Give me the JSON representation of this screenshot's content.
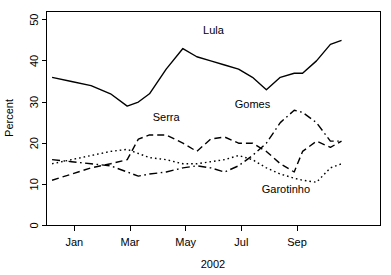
{
  "chart_data": {
    "type": "line",
    "title": "",
    "xlabel": "2002",
    "ylabel": "Percent",
    "xlim": [
      0,
      12
    ],
    "ylim": [
      0,
      52
    ],
    "grid": false,
    "legend": "inline-annotations",
    "x_tick_labels": [
      "Jan",
      "Mar",
      "May",
      "Jul",
      "Sep"
    ],
    "x_tick_values": [
      1,
      3,
      5,
      7,
      9
    ],
    "y_tick_labels": [
      "0",
      "10",
      "20",
      "30",
      "40",
      "50"
    ],
    "y_tick_values": [
      0,
      10,
      20,
      30,
      40,
      50
    ],
    "x": [
      0.2,
      0.9,
      1.6,
      2.3,
      2.9,
      3.3,
      3.7,
      4.3,
      4.9,
      5.4,
      5.9,
      6.4,
      6.9,
      7.4,
      7.9,
      8.4,
      8.9,
      9.2,
      9.7,
      10.2,
      10.6
    ],
    "series": [
      {
        "name": "Lula",
        "style": "solid",
        "label_x": 6.0,
        "label_y": 46.5,
        "values": [
          36,
          35,
          34,
          32,
          29,
          30,
          32,
          38,
          43,
          41,
          40,
          39,
          38,
          36,
          33,
          36,
          37,
          37,
          40,
          44,
          45
        ]
      },
      {
        "name": "Serra",
        "style": "dashed",
        "label_x": 4.3,
        "label_y": 25.5,
        "values": [
          11,
          12.5,
          14,
          15,
          16,
          21,
          22,
          22,
          20,
          18,
          21,
          21.5,
          20,
          20,
          18,
          15,
          13,
          18,
          20.5,
          19,
          20.5
        ]
      },
      {
        "name": "Gomes",
        "style": "dashdot",
        "label_x": 7.4,
        "label_y": 28.5,
        "values": [
          16,
          15.5,
          15,
          14.5,
          13,
          12,
          12.5,
          13,
          14,
          14.5,
          14,
          13,
          14.5,
          17,
          20,
          25,
          28,
          27.5,
          25,
          20.5,
          20.5
        ]
      },
      {
        "name": "Garotinho",
        "style": "dotted",
        "label_x": 8.6,
        "label_y": 8.0,
        "values": [
          15,
          16,
          17,
          18,
          18.5,
          17.5,
          16.5,
          16,
          15,
          15,
          15.5,
          16,
          17,
          16,
          14,
          12.5,
          11.5,
          11,
          10.5,
          14,
          15
        ]
      }
    ]
  }
}
